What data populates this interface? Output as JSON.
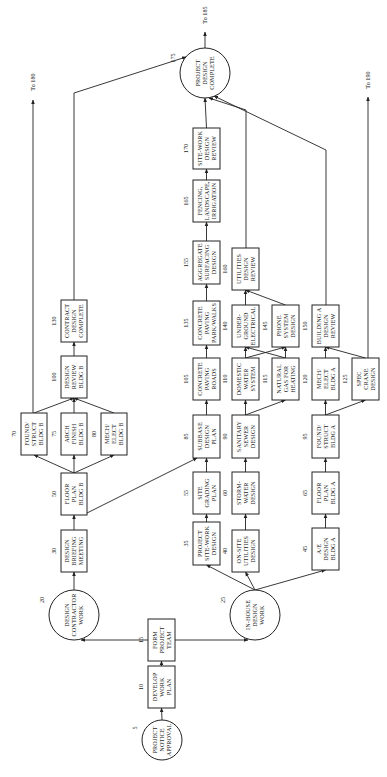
{
  "diagram": {
    "type": "network-precedence-diagram",
    "orientation": "rotated-90-ccw",
    "nodes": [
      {
        "id": "5",
        "shape": "circle",
        "lines": [
          "PROJECT",
          "NOTICE",
          "APPROVAL"
        ]
      },
      {
        "id": "10",
        "shape": "box",
        "lines": [
          "DEVELOP",
          "WORK",
          "PLAN"
        ]
      },
      {
        "id": "15",
        "shape": "box",
        "lines": [
          "FORM",
          "PROJECT",
          "TEAM"
        ]
      },
      {
        "id": "20",
        "shape": "circle",
        "lines": [
          "DESIGN",
          "CONTRACTOR",
          "WORK"
        ]
      },
      {
        "id": "25",
        "shape": "circle",
        "lines": [
          "IN-HOUSE",
          "DESIGN",
          "WORK"
        ]
      },
      {
        "id": "30",
        "shape": "box",
        "lines": [
          "DESIGN",
          "BRIEFING",
          "MEETING"
        ]
      },
      {
        "id": "35",
        "shape": "box",
        "lines": [
          "PROJECT",
          "SITE-WORK",
          "DESIGN"
        ]
      },
      {
        "id": "40",
        "shape": "box",
        "lines": [
          "ON-SITE",
          "UTILITIES",
          "DESIGN"
        ]
      },
      {
        "id": "45",
        "shape": "box",
        "lines": [
          "A/E",
          "DESIGN",
          "BLDG A"
        ]
      },
      {
        "id": "50",
        "shape": "box",
        "lines": [
          "FLOOR",
          "PLAN",
          "BLDG B"
        ]
      },
      {
        "id": "55",
        "shape": "box",
        "lines": [
          "SITE",
          "GRADING",
          "PLAN"
        ]
      },
      {
        "id": "60",
        "shape": "box",
        "lines": [
          "STORM-",
          "WATER",
          "DESIGN"
        ]
      },
      {
        "id": "65",
        "shape": "box",
        "lines": [
          "FLOOR",
          "PLAN",
          "BLDG A"
        ]
      },
      {
        "id": "70",
        "shape": "box",
        "lines": [
          "FOUND/",
          "STRUCT",
          "BLDG B"
        ]
      },
      {
        "id": "75",
        "shape": "box",
        "lines": [
          "ARCH",
          "FINISH",
          "BLDG B"
        ]
      },
      {
        "id": "80",
        "shape": "box",
        "lines": [
          "MECH/",
          "ELECT",
          "BLDG B"
        ]
      },
      {
        "id": "85",
        "shape": "box",
        "lines": [
          "SUBBASE",
          "DESIGN",
          "PLAN"
        ]
      },
      {
        "id": "90",
        "shape": "box",
        "lines": [
          "SANITARY",
          "SEWER",
          "DESIGN"
        ]
      },
      {
        "id": "95",
        "shape": "box",
        "lines": [
          "FOUND/",
          "STRUCT",
          "BLDG A"
        ]
      },
      {
        "id": "100",
        "shape": "box",
        "lines": [
          "DESIGN",
          "REVIEW",
          "BLDG B"
        ]
      },
      {
        "id": "105",
        "shape": "box",
        "lines": [
          "CONCRETE",
          "PAVING",
          "ROADS"
        ]
      },
      {
        "id": "110",
        "shape": "box",
        "lines": [
          "DOMESTIC",
          "WATER",
          "SYSTEM"
        ]
      },
      {
        "id": "115",
        "shape": "box",
        "lines": [
          "NATURAL",
          "GAS FOR",
          "HEATING"
        ]
      },
      {
        "id": "120",
        "shape": "box",
        "lines": [
          "MECH/",
          "ELECT",
          "BLDG A"
        ]
      },
      {
        "id": "125",
        "shape": "box",
        "lines": [
          "SPEC",
          "CRANE",
          "DESIGN"
        ]
      },
      {
        "id": "130",
        "shape": "box",
        "lines": [
          "CONTRACT",
          "DESIGN",
          "COMPLETE"
        ]
      },
      {
        "id": "135",
        "shape": "box",
        "lines": [
          "CONCRETE",
          "PAVING",
          "PARK/WALKS"
        ]
      },
      {
        "id": "140",
        "shape": "box",
        "lines": [
          "UNDER-",
          "GROUND",
          "ELECTRICAL"
        ]
      },
      {
        "id": "145",
        "shape": "box",
        "lines": [
          "PHONE",
          "SYSTEM",
          "DESIGN"
        ]
      },
      {
        "id": "150",
        "shape": "box",
        "lines": [
          "BUILDING A",
          "DESIGN",
          "REVIEW"
        ]
      },
      {
        "id": "155",
        "shape": "box",
        "lines": [
          "AGGREGATE",
          "SURFACING",
          "DESIGN"
        ]
      },
      {
        "id": "160",
        "shape": "box",
        "lines": [
          "UTILITIES",
          "DESIGN",
          "REVIEW"
        ]
      },
      {
        "id": "165",
        "shape": "box",
        "lines": [
          "FENCING,",
          "LANDSCAPE,",
          "IRRIGATION"
        ]
      },
      {
        "id": "170",
        "shape": "box",
        "lines": [
          "SITE-WORK",
          "DESIGN",
          "REVIEW"
        ]
      },
      {
        "id": "175",
        "shape": "circle",
        "lines": [
          "PROJECT",
          "DESIGN",
          "COMPLETE"
        ]
      }
    ],
    "edges": [
      [
        "5",
        "10"
      ],
      [
        "10",
        "15"
      ],
      [
        "15",
        "20"
      ],
      [
        "15",
        "25"
      ],
      [
        "20",
        "30"
      ],
      [
        "30",
        "50"
      ],
      [
        "50",
        "70"
      ],
      [
        "50",
        "75"
      ],
      [
        "50",
        "80"
      ],
      [
        "50",
        "85"
      ],
      [
        "70",
        "100"
      ],
      [
        "75",
        "100"
      ],
      [
        "80",
        "100"
      ],
      [
        "100",
        "130"
      ],
      [
        "130",
        "175"
      ],
      [
        "25",
        "35"
      ],
      [
        "25",
        "40"
      ],
      [
        "25",
        "45"
      ],
      [
        "35",
        "55"
      ],
      [
        "55",
        "85"
      ],
      [
        "85",
        "105"
      ],
      [
        "105",
        "135"
      ],
      [
        "135",
        "155"
      ],
      [
        "155",
        "165"
      ],
      [
        "165",
        "170"
      ],
      [
        "170",
        "175"
      ],
      [
        "40",
        "60"
      ],
      [
        "60",
        "90"
      ],
      [
        "90",
        "110"
      ],
      [
        "90",
        "115"
      ],
      [
        "110",
        "140"
      ],
      [
        "110",
        "145"
      ],
      [
        "115",
        "140"
      ],
      [
        "115",
        "145"
      ],
      [
        "140",
        "160"
      ],
      [
        "145",
        "160"
      ],
      [
        "160",
        "175"
      ],
      [
        "45",
        "65"
      ],
      [
        "65",
        "95"
      ],
      [
        "95",
        "120"
      ],
      [
        "95",
        "125"
      ],
      [
        "120",
        "150"
      ],
      [
        "125",
        "150"
      ],
      [
        "150",
        "175"
      ]
    ],
    "external_links": [
      {
        "from": "70",
        "label": "To 180"
      },
      {
        "from": "175",
        "label": "To 185"
      },
      {
        "from": "125",
        "label": "To 190"
      }
    ]
  }
}
